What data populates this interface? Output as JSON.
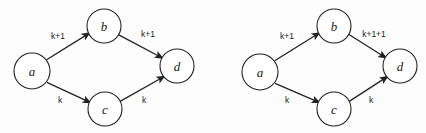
{
  "figure": {
    "background_color": "#fdfdfd",
    "stroke_color": "#222222",
    "node_fill": "#ffffff",
    "diagrams": [
      {
        "id": "left-graph",
        "nodes": [
          {
            "id": "a",
            "label": "a",
            "cx": 32,
            "cy": 71,
            "r": 18
          },
          {
            "id": "b",
            "label": "b",
            "cx": 104,
            "cy": 26,
            "r": 17
          },
          {
            "id": "c",
            "label": "c",
            "cx": 105,
            "cy": 109,
            "r": 17
          },
          {
            "id": "d",
            "label": "d",
            "cx": 177,
            "cy": 66,
            "r": 17
          }
        ],
        "edges": [
          {
            "id": "a-b",
            "from": "a",
            "to": "b",
            "label": "k+1",
            "label_x": 58,
            "label_y": 36
          },
          {
            "id": "b-d",
            "from": "b",
            "to": "d",
            "label": "k+1",
            "label_x": 148,
            "label_y": 34
          },
          {
            "id": "a-c",
            "from": "a",
            "to": "c",
            "label": "k",
            "label_x": 60,
            "label_y": 100
          },
          {
            "id": "c-d",
            "from": "c",
            "to": "d",
            "label": "k",
            "label_x": 144,
            "label_y": 100
          }
        ]
      },
      {
        "id": "right-graph",
        "nodes": [
          {
            "id": "a",
            "label": "a",
            "cx": 47,
            "cy": 72,
            "r": 18
          },
          {
            "id": "b",
            "label": "b",
            "cx": 121,
            "cy": 26,
            "r": 17
          },
          {
            "id": "c",
            "label": "c",
            "cx": 121,
            "cy": 109,
            "r": 17
          },
          {
            "id": "d",
            "label": "d",
            "cx": 187,
            "cy": 66,
            "r": 17
          }
        ],
        "edges": [
          {
            "id": "a-b",
            "from": "a",
            "to": "b",
            "label": "k+1",
            "label_x": 74,
            "label_y": 36
          },
          {
            "id": "b-d",
            "from": "b",
            "to": "d",
            "label": "k+1+1",
            "label_x": 161,
            "label_y": 34
          },
          {
            "id": "a-c",
            "from": "a",
            "to": "c",
            "label": "k",
            "label_x": 74,
            "label_y": 100
          },
          {
            "id": "c-d",
            "from": "c",
            "to": "d",
            "label": "k",
            "label_x": 158,
            "label_y": 100
          }
        ]
      }
    ]
  }
}
